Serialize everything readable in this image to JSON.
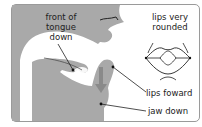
{
  "diagram": {
    "labels": {
      "tongue": [
        "front of",
        "tongue",
        "down"
      ],
      "lips_rounded": [
        "lips very",
        "rounded"
      ],
      "lips_forward": "lips foward",
      "jaw": "jaw down"
    },
    "icons": {
      "head_profile": "head-cross-section",
      "lips_front_view": "rounded-lips-icon",
      "jaw_arrow": "down-arrow"
    },
    "colors": {
      "head_fill": "#a9a9a9",
      "frame_border": "#9a9a9a",
      "leader_line": "#333333",
      "arrow": "#8a8a8a"
    }
  }
}
